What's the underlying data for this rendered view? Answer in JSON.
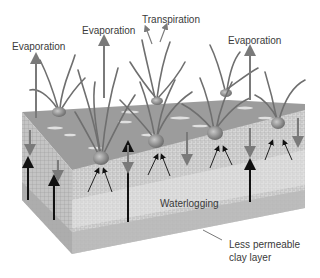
{
  "diagram": {
    "labels": {
      "evaporation_left": "Evaporation",
      "evaporation_center": "Evaporation",
      "transpiration": "Transpiration",
      "evaporation_right": "Evaporation",
      "waterlogging": "Waterlogging",
      "clay_layer_line1": "Less permeable",
      "clay_layer_line2": "clay layer"
    },
    "colors": {
      "surface": "#9a9a9a",
      "soil_front": "#d4d4d4",
      "soil_side": "#c2c2c2",
      "clay": "#b8b8b8",
      "arrow_gray": "#7a7a7a",
      "arrow_dark": "#111111",
      "text": "#3a3a3a"
    }
  }
}
